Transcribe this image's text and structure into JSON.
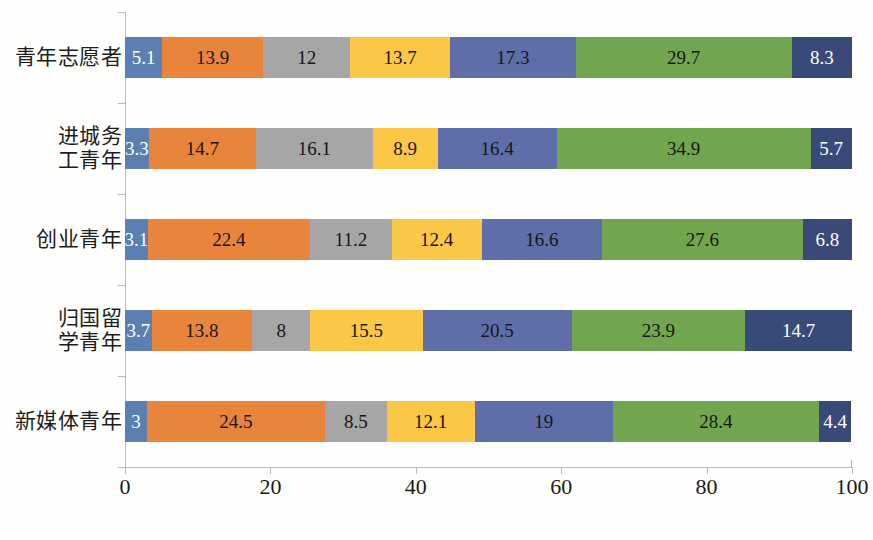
{
  "chart_data": {
    "type": "bar",
    "subtype": "stacked-horizontal-100-percent",
    "title": "",
    "subtitle": "",
    "xlabel": "",
    "ylabel": "",
    "xlim": [
      0,
      100
    ],
    "xticks": [
      "0",
      "20",
      "40",
      "60",
      "80",
      "100"
    ],
    "xtick_values": [
      0,
      20,
      40,
      60,
      80,
      100
    ],
    "grid": false,
    "legend": "none",
    "categories": [
      "青年志愿者",
      "进城务\n工青年",
      "创业青年",
      "归国留\n学青年",
      "新媒体青年"
    ],
    "series": [
      {
        "name": "series-1",
        "color": "#5B7FB0",
        "values": [
          5.1,
          3.3,
          3.1,
          3.7,
          3
        ]
      },
      {
        "name": "series-2",
        "color": "#E8843C",
        "values": [
          13.9,
          14.7,
          22.4,
          13.8,
          24.5
        ]
      },
      {
        "name": "series-3",
        "color": "#A6A6A6",
        "values": [
          12,
          16.1,
          11.2,
          8,
          8.5
        ]
      },
      {
        "name": "series-4",
        "color": "#FBC747",
        "values": [
          13.7,
          8.9,
          12.4,
          15.5,
          12.1
        ]
      },
      {
        "name": "series-5",
        "color": "#5F6EA9",
        "values": [
          17.3,
          16.4,
          16.6,
          20.5,
          19
        ]
      },
      {
        "name": "series-6",
        "color": "#72A64E",
        "values": [
          29.7,
          34.9,
          27.6,
          23.9,
          28.4
        ]
      },
      {
        "name": "series-7",
        "color": "#3A4A78",
        "values": [
          8.3,
          5.7,
          6.8,
          14.7,
          4.4
        ]
      }
    ],
    "label_text_colors": [
      [
        "light",
        "dark",
        "dark",
        "dark",
        "dark",
        "dark",
        "light"
      ],
      [
        "light",
        "dark",
        "dark",
        "dark",
        "dark",
        "dark",
        "light"
      ],
      [
        "light",
        "dark",
        "dark",
        "dark",
        "dark",
        "dark",
        "light"
      ],
      [
        "light",
        "dark",
        "dark",
        "dark",
        "dark",
        "dark",
        "light"
      ],
      [
        "light",
        "dark",
        "dark",
        "dark",
        "dark",
        "dark",
        "light"
      ]
    ],
    "bar_labels": [
      [
        "5.1",
        "13.9",
        "12",
        "13.7",
        "17.3",
        "29.7",
        "8.3"
      ],
      [
        "3.3",
        "14.7",
        "16.1",
        "8.9",
        "16.4",
        "34.9",
        "5.7"
      ],
      [
        "3.1",
        "22.4",
        "11.2",
        "12.4",
        "16.6",
        "27.6",
        "6.8"
      ],
      [
        "3.7",
        "13.8",
        "8",
        "15.5",
        "20.5",
        "23.9",
        "14.7"
      ],
      [
        "3",
        "24.5",
        "8.5",
        "12.1",
        "19",
        "28.4",
        "4.4"
      ]
    ]
  },
  "axis": {
    "x_tick_labels": [
      "0",
      "20",
      "40",
      "60",
      "80",
      "100"
    ]
  },
  "colors": {
    "background": "#fefefc",
    "axis_line": "#b9b9b9",
    "series_1": "#5B7FB0",
    "series_2": "#E8843C",
    "series_3": "#A6A6A6",
    "series_4": "#FBC747",
    "series_5": "#5F6EA9",
    "series_6": "#72A64E",
    "series_7": "#3A4A78"
  }
}
